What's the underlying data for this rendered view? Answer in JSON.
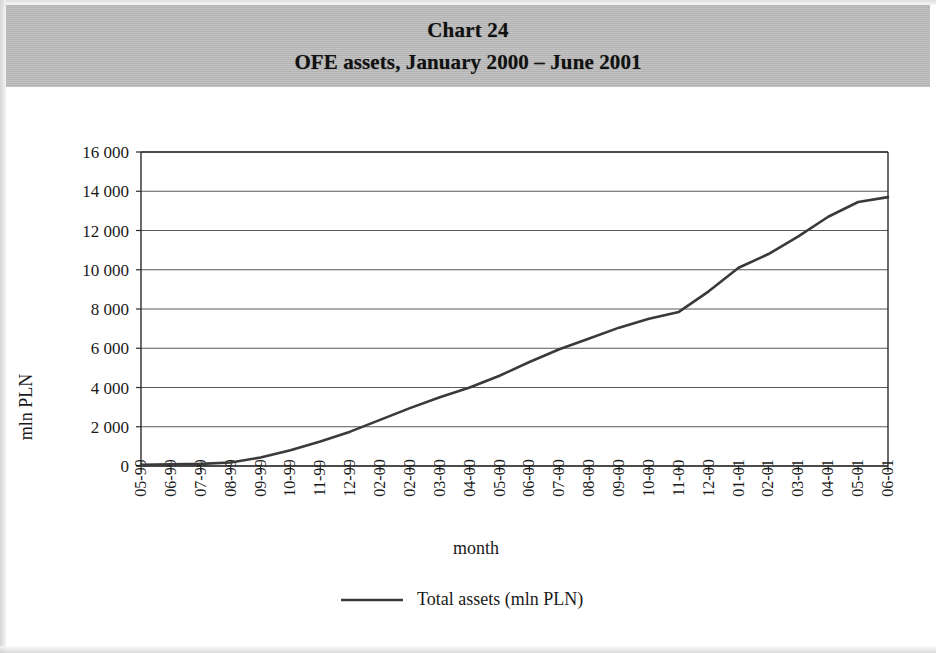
{
  "title": {
    "line1": "Chart 24",
    "line2": "OFE assets, January 2000 – June 2001"
  },
  "chart_data": {
    "type": "line",
    "title": "OFE assets, January 2000 – June 2001",
    "xlabel": "month",
    "ylabel": "mln PLN",
    "ylim": [
      0,
      16000
    ],
    "yticks": [
      0,
      2000,
      4000,
      6000,
      8000,
      10000,
      12000,
      14000,
      16000
    ],
    "ytick_labels": [
      "0",
      "2 000",
      "4 000",
      "6 000",
      "8 000",
      "10 000",
      "12 000",
      "14 000",
      "16 000"
    ],
    "grid": true,
    "legend_position": "bottom",
    "categories": [
      "05-99",
      "06-99",
      "07-99",
      "08-99",
      "09-99",
      "10-99",
      "11-99",
      "12-99",
      "02-00",
      "02-00",
      "03-00",
      "04-00",
      "05-00",
      "06-00",
      "07-00",
      "08-00",
      "09-00",
      "10-00",
      "11-00",
      "12-00",
      "01-01",
      "02-01",
      "03-01",
      "04-01",
      "05-01",
      "06-01"
    ],
    "series": [
      {
        "name": "Total assets (mln PLN)",
        "color": "#3a3a3a",
        "values": [
          60,
          90,
          110,
          180,
          430,
          800,
          1250,
          1750,
          2350,
          2950,
          3500,
          4000,
          4600,
          5300,
          5950,
          6500,
          7050,
          7500,
          7850,
          8900,
          10100,
          10800,
          11700,
          12700,
          13450,
          13700
        ]
      }
    ]
  },
  "legend": {
    "items": [
      {
        "label": "Total assets (mln PLN)",
        "color": "#3a3a3a"
      }
    ]
  }
}
